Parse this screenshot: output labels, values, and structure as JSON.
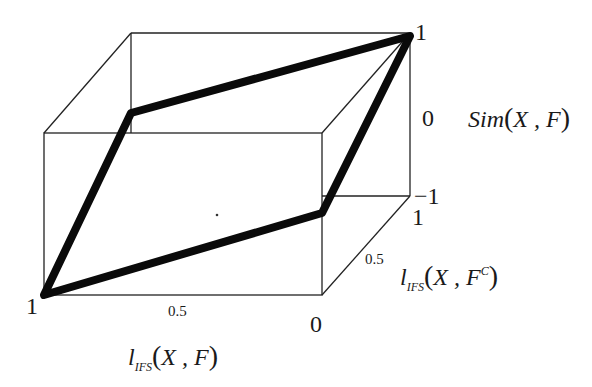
{
  "diagram": {
    "type": "3d-box-plot",
    "axes": {
      "x": {
        "label_fn": "l",
        "label_sub": "IFS",
        "label_args": "X , F",
        "ticks": [
          "1",
          "0.5",
          "0"
        ]
      },
      "y": {
        "label_fn": "l",
        "label_sub": "IFS",
        "label_args_pre": "X , F",
        "label_sup": "C",
        "ticks": [
          "0",
          "0.5",
          "1"
        ]
      },
      "z": {
        "label": "Sim",
        "label_args": "X , F",
        "ticks": [
          "-1",
          "0",
          "1"
        ]
      }
    },
    "path_vertices": [
      {
        "x_l_ifs_XF": 1,
        "y_l_ifs_XFc": 0,
        "z_sim": -1
      },
      {
        "x_l_ifs_XF": 1,
        "y_l_ifs_XFc": 1,
        "z_sim": 0
      },
      {
        "x_l_ifs_XF": 0,
        "y_l_ifs_XFc": 1,
        "z_sim": 1
      },
      {
        "x_l_ifs_XF": 0,
        "y_l_ifs_XFc": 0,
        "z_sim": 0
      }
    ]
  },
  "labels": {
    "x_tick_1": "1",
    "x_tick_05": "0.5",
    "x_tick_0": "0",
    "y_tick_05": "0.5",
    "y_tick_1": "1",
    "z_tick_top": "1",
    "z_tick_mid": "0",
    "z_tick_bottom": "−1",
    "x_label_fn": "l",
    "x_label_sub": "IFS",
    "x_label_args": "X , F",
    "y_label_fn": "l",
    "y_label_sub": "IFS",
    "y_label_args": "X , F",
    "y_label_sup": "C",
    "z_label_fn": "Sim",
    "z_label_args": "X , F",
    "paren_open": "(",
    "paren_close": ")"
  }
}
